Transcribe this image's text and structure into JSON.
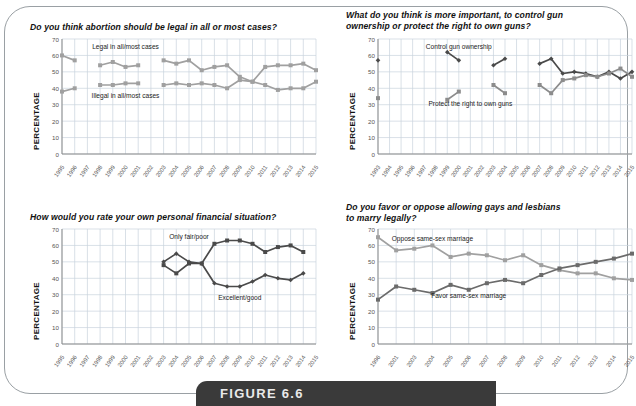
{
  "figure": {
    "caption_label": "FIGURE 6.6",
    "axis_label": "PERCENTAGE",
    "colors": {
      "dark_series": "#4a4a4a",
      "light_series": "#a0a0a0",
      "grid": "#c9d3dd",
      "axis": "#8b8b8b",
      "banner_bg": "#3a3a3a",
      "frame": "#9aa0a4"
    }
  },
  "chart_data": [
    {
      "id": "abortion",
      "type": "line",
      "title": "Do you think abortion should be legal in all or most cases?",
      "xlabel": "",
      "ylabel": "PERCENTAGE",
      "ylim": [
        0,
        70
      ],
      "yticks": [
        0,
        10,
        20,
        30,
        40,
        50,
        60,
        70
      ],
      "grid": true,
      "legend_position": "inline-annotation",
      "categories": [
        "1995",
        "1996",
        "1997",
        "1998",
        "1999",
        "2000",
        "2001",
        "2002",
        "2003",
        "2004",
        "2005",
        "2006",
        "2007",
        "2008",
        "2009",
        "2010",
        "2011",
        "2012",
        "2013",
        "2014",
        "2015"
      ],
      "series": [
        {
          "name": "Legal in all/most cases",
          "color": "#a0a0a0",
          "values": [
            60,
            57,
            null,
            54,
            56,
            53,
            54,
            null,
            57,
            55,
            57,
            51,
            53,
            54,
            47,
            44,
            53,
            54,
            54,
            55,
            51
          ]
        },
        {
          "name": "Illegal in all/most cases",
          "color": "#a0a0a0",
          "values": [
            38,
            40,
            null,
            42,
            42,
            43,
            43,
            null,
            42,
            43,
            42,
            43,
            42,
            40,
            45,
            44,
            42,
            39,
            40,
            40,
            44
          ]
        }
      ],
      "annotations": [
        {
          "text": "Legal in all/most cases",
          "x": "2000",
          "y": 64
        },
        {
          "text": "Illegal in all/most cases",
          "x": "2000",
          "y": 34
        }
      ]
    },
    {
      "id": "guns",
      "type": "line",
      "title": "What do you think is more important, to control gun ownership or protect the right to own guns?",
      "xlabel": "",
      "ylabel": "PERCENTAGE",
      "ylim": [
        0,
        70
      ],
      "yticks": [
        0,
        10,
        20,
        30,
        40,
        50,
        60,
        70
      ],
      "grid": true,
      "legend_position": "inline-annotation",
      "categories": [
        "1993",
        "1994",
        "1995",
        "1996",
        "1997",
        "1998",
        "1999",
        "2000",
        "2001",
        "2002",
        "2003",
        "2004",
        "2005",
        "2006",
        "2007",
        "2008",
        "2009",
        "2010",
        "2011",
        "2012",
        "2013",
        "2014",
        "2015"
      ],
      "series": [
        {
          "name": "Control gun ownership",
          "color": "#4a4a4a",
          "values": [
            57,
            null,
            null,
            null,
            null,
            null,
            62,
            57,
            null,
            null,
            54,
            58,
            null,
            null,
            55,
            58,
            49,
            50,
            49,
            47,
            50,
            46,
            50
          ]
        },
        {
          "name": "Protect the right to own guns",
          "color": "#8c8c8c",
          "values": [
            34,
            null,
            null,
            null,
            null,
            null,
            33,
            38,
            null,
            null,
            42,
            37,
            null,
            null,
            42,
            37,
            45,
            46,
            48,
            47,
            49,
            52,
            47
          ]
        }
      ],
      "annotations": [
        {
          "text": "Control gun ownership",
          "x": "2000",
          "y": 64
        },
        {
          "text": "Protect the right to own guns",
          "x": "2001",
          "y": 29
        }
      ]
    },
    {
      "id": "finance",
      "type": "line",
      "title": "How would you rate your own personal financial situation?",
      "xlabel": "",
      "ylabel": "PERCENTAGE",
      "ylim": [
        0,
        70
      ],
      "yticks": [
        0,
        10,
        20,
        30,
        40,
        50,
        60,
        70
      ],
      "grid": true,
      "legend_position": "inline-annotation",
      "categories": [
        "1995",
        "1996",
        "1997",
        "1998",
        "1999",
        "2000",
        "2001",
        "2002",
        "2003",
        "2004",
        "2005",
        "2006",
        "2007",
        "2008",
        "2009",
        "2010",
        "2011",
        "2012",
        "2013",
        "2014",
        "2015"
      ],
      "series": [
        {
          "name": "Only fair/poor",
          "color": "#4a4a4a",
          "values": [
            null,
            null,
            null,
            null,
            null,
            null,
            null,
            null,
            48,
            43,
            49,
            49,
            61,
            63,
            63,
            61,
            56,
            59,
            60,
            56,
            null
          ]
        },
        {
          "name": "Excellent/good",
          "color": "#4a4a4a",
          "values": [
            null,
            null,
            null,
            null,
            null,
            null,
            null,
            null,
            50,
            55,
            50,
            49,
            37,
            35,
            35,
            38,
            42,
            40,
            39,
            43,
            null
          ]
        }
      ],
      "annotations": [
        {
          "text": "Only fair/poor",
          "x": "2005",
          "y": 64
        },
        {
          "text": "Excellent/good",
          "x": "2009",
          "y": 27
        }
      ]
    },
    {
      "id": "marriage",
      "type": "line",
      "title": "Do you favor or oppose allowing gays and lesbians to marry legally?",
      "xlabel": "",
      "ylabel": "PERCENTAGE",
      "ylim": [
        0,
        70
      ],
      "yticks": [
        0,
        10,
        20,
        30,
        40,
        50,
        60,
        70
      ],
      "grid": true,
      "legend_position": "inline-annotation",
      "categories": [
        "1996",
        "2001",
        "2003",
        "2004",
        "2005",
        "2006",
        "2007",
        "2008",
        "2009",
        "2010",
        "2011",
        "2012",
        "2013",
        "2014",
        "2015"
      ],
      "series": [
        {
          "name": "Oppose same-sex marriage",
          "color": "#a0a0a0",
          "values": [
            65,
            57,
            58,
            60,
            53,
            55,
            54,
            51,
            54,
            48,
            45,
            43,
            43,
            40,
            39
          ]
        },
        {
          "name": "Favor same-sex marriage",
          "color": "#6b6b6b",
          "values": [
            27,
            35,
            33,
            31,
            36,
            33,
            37,
            39,
            37,
            42,
            46,
            48,
            50,
            52,
            55
          ]
        }
      ],
      "annotations": [
        {
          "text": "Oppose same-sex marriage",
          "x": "2004",
          "y": 63
        },
        {
          "text": "Favor same-sex marriage",
          "x": "2006",
          "y": 28
        }
      ]
    }
  ]
}
